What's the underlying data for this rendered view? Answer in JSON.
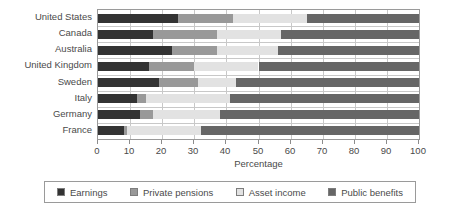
{
  "chart_data": {
    "type": "bar",
    "orientation": "horizontal",
    "stacked": true,
    "title": "",
    "xlabel": "Percentage",
    "ylabel": "",
    "xlim": [
      0,
      100
    ],
    "xticks": [
      0,
      10,
      20,
      30,
      40,
      50,
      60,
      70,
      80,
      90,
      100
    ],
    "xtick_labels": [
      "0",
      "10",
      "20",
      "30",
      "40",
      "50",
      "60",
      "70",
      "80",
      "90",
      "100"
    ],
    "grid": "vertical",
    "legend_position": "bottom",
    "categories": [
      "United States",
      "Canada",
      "Australia",
      "United Kingdom",
      "Sweden",
      "Italy",
      "Germany",
      "France"
    ],
    "series": [
      {
        "name": "Earnings",
        "color": "#333333",
        "values": [
          25,
          17,
          23,
          16,
          19,
          12,
          13,
          8
        ]
      },
      {
        "name": "Private pensions",
        "color": "#999999",
        "values": [
          17,
          20,
          14,
          14,
          12,
          3,
          4,
          1
        ]
      },
      {
        "name": "Asset income",
        "color": "#e2e2e2",
        "values": [
          23,
          20,
          19,
          20,
          12,
          26,
          21,
          23
        ]
      },
      {
        "name": "Public benefits",
        "color": "#666666",
        "values": [
          35,
          43,
          44,
          50,
          57,
          59,
          62,
          68
        ]
      }
    ],
    "cumulative_boundaries": [
      [
        25,
        42,
        65,
        100
      ],
      [
        17,
        37,
        57,
        100
      ],
      [
        23,
        37,
        56,
        100
      ],
      [
        16,
        30,
        50,
        100
      ],
      [
        19,
        31,
        43,
        100
      ],
      [
        12,
        15,
        41,
        100
      ],
      [
        13,
        17,
        38,
        100
      ],
      [
        8,
        9,
        32,
        100
      ]
    ]
  },
  "legend": {
    "items": [
      {
        "label": "Earnings",
        "swatch_name": "legend-swatch-earnings"
      },
      {
        "label": "Private pensions",
        "swatch_name": "legend-swatch-private-pensions"
      },
      {
        "label": "Asset income",
        "swatch_name": "legend-swatch-asset-income"
      },
      {
        "label": "Public benefits",
        "swatch_name": "legend-swatch-public-benefits"
      }
    ]
  },
  "axis": {
    "x_title": "Percentage"
  }
}
